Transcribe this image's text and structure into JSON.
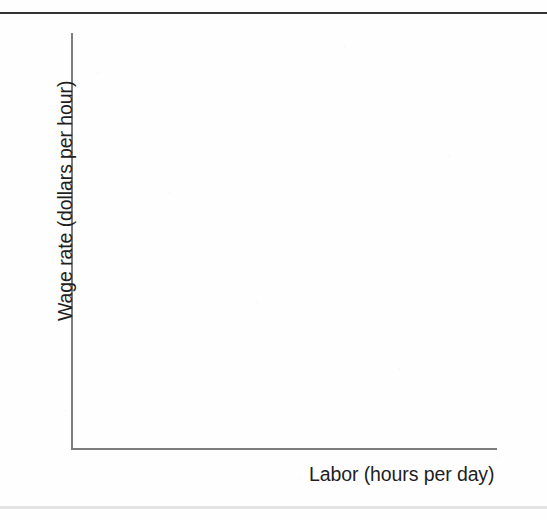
{
  "figure": {
    "background_color": "#fefefe",
    "rule_color": "#333333",
    "axis_color": "#7d7d7d",
    "text_color": "#1f1f1f",
    "width": 547,
    "height": 520
  },
  "chart_data": {
    "type": "line",
    "title": "",
    "subtitle": "",
    "xlabel": "Labor (hours per day)",
    "ylabel": "Wage rate (dollars per hour)",
    "xticklabels": [],
    "yticklabels": [],
    "xlim": [
      0,
      0
    ],
    "ylim": [
      0,
      0
    ],
    "grid": false,
    "legend": false,
    "legend_position": "none",
    "series": [],
    "annotations": [],
    "note": "Blank coordinate axes — no plotted data, no tick marks, no tick labels. Only the two axis lines and the two axis titles are drawn."
  },
  "elements": {
    "top_rule_label": "page-top-rule",
    "bottom_rule_label": "page-bottom-band",
    "plot_area_label": "empty-plot-area"
  }
}
